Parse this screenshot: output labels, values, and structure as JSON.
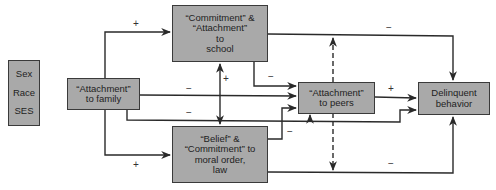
{
  "controls": {
    "items": [
      "Sex",
      "Race",
      "SES"
    ]
  },
  "nodes": {
    "family": {
      "lines": [
        "“Attachment”",
        "to family"
      ]
    },
    "school": {
      "lines": [
        "“Commitment” &",
        "“Attachment”",
        "to",
        "school"
      ]
    },
    "belief": {
      "lines": [
        "“Belief” &",
        "“Commitment” to",
        "moral order,",
        "law"
      ]
    },
    "peers": {
      "lines": [
        "“Attachment”",
        "to peers"
      ]
    },
    "delinquent": {
      "lines": [
        "Delinquent",
        "behavior"
      ]
    }
  },
  "edges": [
    {
      "from": "family",
      "to": "school",
      "sign": "+"
    },
    {
      "from": "family",
      "to": "belief",
      "sign": "+"
    },
    {
      "from": "family",
      "to": "peers",
      "sign": "−"
    },
    {
      "from": "family",
      "to": "delinquent",
      "sign": "−"
    },
    {
      "from": "school",
      "to": "peers",
      "sign": "−"
    },
    {
      "from": "school",
      "to": "delinquent",
      "sign": "−"
    },
    {
      "from": "school",
      "to": "belief",
      "sign": "+",
      "bidirectional": true
    },
    {
      "from": "belief",
      "to": "peers",
      "sign": "−"
    },
    {
      "from": "belief",
      "to": "delinquent",
      "sign": "−"
    },
    {
      "from": "peers",
      "to": "delinquent",
      "sign": "+"
    },
    {
      "from": "peers",
      "to": "school",
      "style": "dashed"
    },
    {
      "from": "peers",
      "to": "belief",
      "style": "dashed"
    }
  ],
  "signs": {
    "family_school": "+",
    "family_belief": "+",
    "school_belief": "+",
    "family_peers": "−",
    "family_delinquent": "−",
    "school_peers": "−",
    "school_delinquent": "−",
    "belief_peers": "−",
    "belief_delinquent": "−",
    "peers_delinquent": "+"
  }
}
